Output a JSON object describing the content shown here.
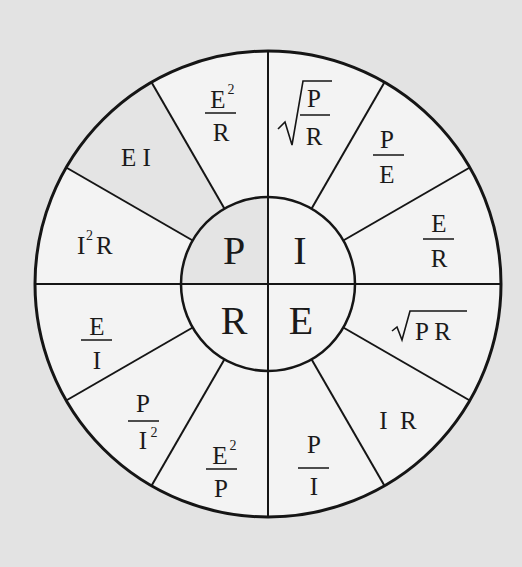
{
  "diagram": {
    "colors": {
      "background": "#e3e3e3",
      "sector_light": "#f3f3f3",
      "sector_shaded": "#e4e4e4",
      "line": "#151515",
      "text": "#1a1a1a"
    },
    "center": {
      "quadrants": [
        {
          "id": "P",
          "label": "P",
          "meaning": "power",
          "shaded": true
        },
        {
          "id": "I",
          "label": "I",
          "meaning": "current",
          "shaded": false
        },
        {
          "id": "R",
          "label": "R",
          "meaning": "resistance",
          "shaded": false
        },
        {
          "id": "E",
          "label": "E",
          "meaning": "voltage",
          "shaded": false
        }
      ]
    },
    "sectors": {
      "P": [
        {
          "id": "ei",
          "text": "E I",
          "shaded": true
        },
        {
          "id": "e2_over_r",
          "num": "E",
          "num_sup": "2",
          "den": "R",
          "shaded": false
        },
        {
          "id": "i2r",
          "text": "I",
          "sup": "2",
          "tail": "R",
          "shaded": false
        }
      ],
      "I": [
        {
          "id": "sqrt_p_over_r",
          "num": "P",
          "den": "R",
          "radical": "√"
        },
        {
          "id": "p_over_e",
          "num": "P",
          "den": "E"
        },
        {
          "id": "e_over_r",
          "num": "E",
          "den": "R"
        }
      ],
      "E": [
        {
          "id": "sqrt_pr",
          "radical": "√",
          "text": "P R"
        },
        {
          "id": "ir",
          "text": "I  R"
        },
        {
          "id": "p_over_i",
          "num": "P",
          "den": "I"
        }
      ],
      "R": [
        {
          "id": "e2_over_p",
          "num": "E",
          "num_sup": "2",
          "den": "P"
        },
        {
          "id": "p_over_i2",
          "num": "P",
          "den": "I",
          "den_sup": "2"
        },
        {
          "id": "e_over_i",
          "num": "E",
          "den": "I"
        }
      ]
    }
  }
}
